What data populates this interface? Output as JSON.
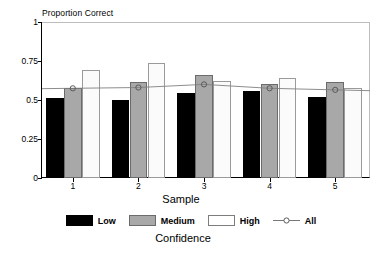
{
  "chart_data": {
    "type": "bar",
    "title": "",
    "ylabel": "Proportion Correct",
    "xlabel": "Sample",
    "legend_title": "Confidence",
    "legend_position": "bottom",
    "grid": false,
    "categories": [
      "1",
      "2",
      "3",
      "4",
      "5"
    ],
    "ytick_labels": [
      "1",
      "0.75",
      "0.5",
      "0.25",
      "0"
    ],
    "ytick_values": [
      1,
      0.75,
      0.5,
      0.25,
      0
    ],
    "ylim": [
      0,
      1
    ],
    "series": [
      {
        "name": "Low",
        "type": "bar",
        "color": "#000000",
        "values": [
          0.51,
          0.5,
          0.545,
          0.56,
          0.52
        ]
      },
      {
        "name": "Medium",
        "type": "bar",
        "color": "#a8a8a8",
        "values": [
          0.58,
          0.615,
          0.66,
          0.6,
          0.615
        ]
      },
      {
        "name": "High",
        "type": "bar",
        "color": "#ffffff",
        "values": [
          0.69,
          0.735,
          0.625,
          0.64,
          0.58
        ]
      },
      {
        "name": "All",
        "type": "line",
        "color": "#808080",
        "marker": "circle",
        "values": [
          0.575,
          0.58,
          0.6,
          0.575,
          0.565
        ]
      }
    ]
  },
  "legend": {
    "items": [
      {
        "label": "Low",
        "swatch": "low"
      },
      {
        "label": "Medium",
        "swatch": "medium"
      },
      {
        "label": "High",
        "swatch": "high"
      },
      {
        "label": "All",
        "swatch": "line"
      }
    ],
    "title": "Confidence"
  },
  "axes": {
    "y_title": "Proportion Correct",
    "x_title": "Sample"
  }
}
